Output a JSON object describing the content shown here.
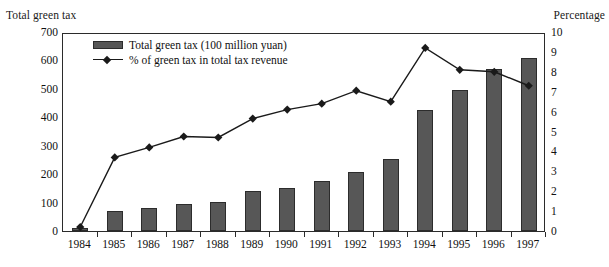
{
  "axis_titles": {
    "left": "Total green tax",
    "right": "Percentage"
  },
  "legend": {
    "bar_label": "Total green tax (100 million yuan)",
    "line_label": "% of green tax in total tax revenue",
    "bar_swatch_icon": "filled-rectangle-icon",
    "line_swatch_icon": "line-with-diamond-marker-icon"
  },
  "chart_data": {
    "type": "bar",
    "title": "",
    "subtitle": "",
    "xlabel": "",
    "ylabel": "Total green tax",
    "y2label": "Percentage",
    "categories": [
      "1984",
      "1985",
      "1986",
      "1987",
      "1988",
      "1989",
      "1990",
      "1991",
      "1992",
      "1993",
      "1994",
      "1995",
      "1996",
      "1997"
    ],
    "ylim": [
      0,
      700
    ],
    "yticks": [
      0,
      100,
      200,
      300,
      400,
      500,
      600,
      700
    ],
    "y2lim": [
      0,
      10
    ],
    "y2ticks": [
      0,
      1,
      2,
      3,
      4,
      5,
      6,
      7,
      8,
      9,
      10
    ],
    "grid": false,
    "legend_position": "top-left-inside",
    "series": [
      {
        "name": "Total green tax (100 million yuan)",
        "type": "bar",
        "axis": "left",
        "color": "#575757",
        "values": [
          10,
          70,
          80,
          95,
          103,
          140,
          153,
          175,
          208,
          253,
          425,
          495,
          570,
          608
        ]
      },
      {
        "name": "% of green tax in total tax revenue",
        "type": "line",
        "axis": "right",
        "color": "#1a1a1a",
        "marker": "diamond",
        "values": [
          0.3,
          3.8,
          4.3,
          4.85,
          4.8,
          5.75,
          6.2,
          6.5,
          7.15,
          6.6,
          9.3,
          8.2,
          8.1,
          7.4
        ]
      }
    ]
  }
}
